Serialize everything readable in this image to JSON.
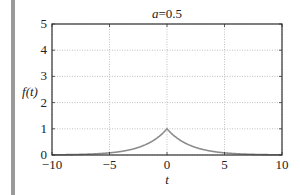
{
  "chart_data": {
    "type": "line",
    "title": "a=0.5",
    "title_parts": {
      "var": "a",
      "rest": "=0.5"
    },
    "xlabel": "t",
    "ylabel": "f(t)",
    "xlim": [
      -10,
      10
    ],
    "ylim": [
      0,
      5
    ],
    "xticks": [
      -10,
      -5,
      0,
      5,
      10
    ],
    "yticks": [
      0,
      1,
      2,
      3,
      4,
      5
    ],
    "xtick_labels": [
      "−10",
      "−5",
      "0",
      "5",
      "10"
    ],
    "ytick_labels": [
      "0",
      "1",
      "2",
      "3",
      "4",
      "5"
    ],
    "grid": true,
    "legend": null,
    "series": [
      {
        "name": "f(t) = exp(-a|t|)",
        "color": "#8c8c8c",
        "x": [
          -10,
          -8,
          -6,
          -5,
          -4,
          -3,
          -2,
          -1,
          0,
          1,
          2,
          3,
          4,
          5,
          6,
          8,
          10
        ],
        "y": [
          0.007,
          0.018,
          0.05,
          0.082,
          0.135,
          0.223,
          0.368,
          0.607,
          1.0,
          0.607,
          0.368,
          0.223,
          0.135,
          0.082,
          0.05,
          0.018,
          0.007
        ]
      }
    ]
  },
  "colors": {
    "axis": "#333333",
    "grid": "#b0b0b0",
    "curve": "#8c8c8c",
    "side_bar": "#9a9a9a"
  }
}
